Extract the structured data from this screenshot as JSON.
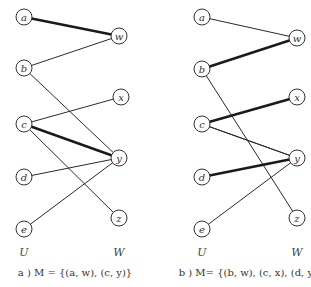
{
  "diagrams": [
    {
      "id": "a",
      "caption": "a ) M = {(a, w), (c, y)}",
      "set_labels": {
        "left": "U",
        "right": "W"
      },
      "nodes": {
        "a": {
          "label": "a",
          "x": 24,
          "y": 17
        },
        "b": {
          "label": "b",
          "x": 24,
          "y": 68
        },
        "c": {
          "label": "c",
          "x": 24,
          "y": 124
        },
        "d": {
          "label": "d",
          "x": 24,
          "y": 177
        },
        "e": {
          "label": "e",
          "x": 24,
          "y": 229
        },
        "w": {
          "label": "w",
          "x": 119,
          "y": 36
        },
        "x": {
          "label": "x",
          "x": 121,
          "y": 97
        },
        "y": {
          "label": "y",
          "x": 119,
          "y": 158
        },
        "z": {
          "label": "z",
          "x": 119,
          "y": 218
        }
      },
      "edges": [
        {
          "from": "a",
          "to": "w",
          "matched": true
        },
        {
          "from": "b",
          "to": "w",
          "matched": false
        },
        {
          "from": "b",
          "to": "y",
          "matched": false
        },
        {
          "from": "c",
          "to": "x",
          "matched": false
        },
        {
          "from": "c",
          "to": "y",
          "matched": true
        },
        {
          "from": "c",
          "to": "z",
          "matched": false
        },
        {
          "from": "d",
          "to": "y",
          "matched": false
        },
        {
          "from": "e",
          "to": "y",
          "matched": false
        }
      ]
    },
    {
      "id": "b",
      "caption": "b ) M= {(b, w), (c, x), (d, y)}",
      "set_labels": {
        "left": "U",
        "right": "W"
      },
      "nodes": {
        "a": {
          "label": "a",
          "x": 202,
          "y": 17
        },
        "b": {
          "label": "b",
          "x": 202,
          "y": 69
        },
        "c": {
          "label": "c",
          "x": 202,
          "y": 124
        },
        "d": {
          "label": "d",
          "x": 202,
          "y": 177
        },
        "e": {
          "label": "e",
          "x": 202,
          "y": 229
        },
        "w": {
          "label": "w",
          "x": 297,
          "y": 38
        },
        "x": {
          "label": "x",
          "x": 297,
          "y": 97
        },
        "y": {
          "label": "y",
          "x": 297,
          "y": 158
        },
        "z": {
          "label": "z",
          "x": 297,
          "y": 218
        }
      },
      "edges": [
        {
          "from": "a",
          "to": "w",
          "matched": false
        },
        {
          "from": "b",
          "to": "w",
          "matched": true
        },
        {
          "from": "b",
          "to": "z",
          "matched": false
        },
        {
          "from": "c",
          "to": "x",
          "matched": true
        },
        {
          "from": "c",
          "to": "y",
          "matched": false
        },
        {
          "from": "c",
          "to": "y2",
          "matched": false
        },
        {
          "from": "d",
          "to": "y",
          "matched": true
        },
        {
          "from": "e",
          "to": "y",
          "matched": false
        }
      ]
    }
  ]
}
